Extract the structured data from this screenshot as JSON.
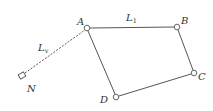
{
  "diagram": {
    "nodes": [
      {
        "id": "A",
        "label": "A",
        "x": 87,
        "y": 28,
        "shape": "circle"
      },
      {
        "id": "B",
        "label": "B",
        "x": 177,
        "y": 27,
        "shape": "circle"
      },
      {
        "id": "C",
        "label": "C",
        "x": 194,
        "y": 73,
        "shape": "circle"
      },
      {
        "id": "D",
        "label": "D",
        "x": 116,
        "y": 97,
        "shape": "circle"
      },
      {
        "id": "N",
        "label": "N",
        "x": 22,
        "y": 76,
        "shape": "square"
      }
    ],
    "edges": [
      {
        "from": "A",
        "to": "B",
        "style": "solid",
        "label": "L",
        "label_sub": "1"
      },
      {
        "from": "B",
        "to": "C",
        "style": "solid"
      },
      {
        "from": "C",
        "to": "D",
        "style": "solid"
      },
      {
        "from": "D",
        "to": "A",
        "style": "solid"
      },
      {
        "from": "N",
        "to": "A",
        "style": "dashed",
        "label": "L",
        "label_sub": "v"
      }
    ],
    "colors": {
      "line": "#555555",
      "text": "#333333"
    }
  }
}
